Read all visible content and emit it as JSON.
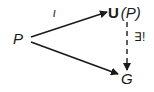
{
  "diagram": {
    "nodes": {
      "source": {
        "text": "P"
      },
      "universal": {
        "bold_part": "U",
        "paren_part": "(P)"
      },
      "target": {
        "text": "G"
      }
    },
    "arrows": {
      "inclusion": {
        "label": "ι",
        "from": "P",
        "to": "U(P)",
        "style": "solid"
      },
      "map": {
        "label": "",
        "from": "P",
        "to": "G",
        "style": "solid"
      },
      "unique": {
        "label": "∃!",
        "from": "U(P)",
        "to": "G",
        "style": "dashed"
      }
    },
    "colors": {
      "ink": "#1a1a1a",
      "background": "#ffffff"
    }
  }
}
